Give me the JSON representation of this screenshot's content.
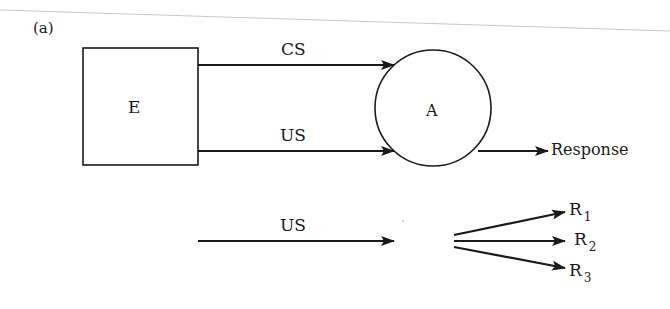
{
  "figure": {
    "panel_label": "(a)",
    "nodes": {
      "environment": {
        "label": "E",
        "shape": "square"
      },
      "animal": {
        "label": "A",
        "shape": "circle"
      }
    },
    "edges": {
      "cs": {
        "label": "CS",
        "from": "E",
        "to": "A"
      },
      "us": {
        "label": "US",
        "from": "E",
        "to": "A"
      },
      "response": {
        "label": "Response",
        "from": "A"
      }
    },
    "lower": {
      "us_label": "US",
      "responses": [
        {
          "letter": "R",
          "sub": "1"
        },
        {
          "letter": "R",
          "sub": "2"
        },
        {
          "letter": "R",
          "sub": "3"
        }
      ]
    },
    "colors": {
      "ink": "#1a1a1a",
      "scan_line": "#c8c8c8",
      "background": "#ffffff"
    }
  }
}
